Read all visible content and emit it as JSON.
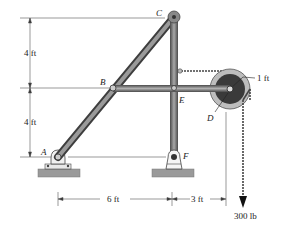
{
  "labels": {
    "A": "A",
    "B": "B",
    "C": "C",
    "D": "D",
    "E": "E",
    "F": "F"
  },
  "dimensions": {
    "upper_vertical": "4 ft",
    "lower_vertical": "4 ft",
    "horizontal_left": "6 ft",
    "horizontal_right": "3 ft",
    "pulley_radius": "1 ft"
  },
  "load": {
    "value": "300 lb"
  },
  "colors": {
    "member": "#7a7a7a",
    "member_dark": "#4a4a4a",
    "pulley_outer": "#b8b8b8",
    "pulley_inner": "#3a3a3a",
    "ground": "#9a9a9a",
    "line": "#333333"
  }
}
